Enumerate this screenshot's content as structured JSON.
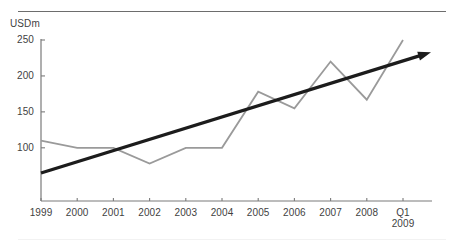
{
  "figure": {
    "top_partial_title": "",
    "unit_label": "USDm"
  },
  "chart_data": {
    "type": "line",
    "title": "",
    "subtitle": "",
    "xlabel": "",
    "ylabel": "USDm",
    "categories": [
      "1999",
      "2000",
      "2001",
      "2002",
      "2003",
      "2004",
      "2005",
      "2006",
      "2007",
      "2008",
      "Q1 2009"
    ],
    "x_tick_labels": [
      {
        "line1": "1999",
        "line2": ""
      },
      {
        "line1": "2000",
        "line2": ""
      },
      {
        "line1": "2001",
        "line2": ""
      },
      {
        "line1": "2002",
        "line2": ""
      },
      {
        "line1": "2003",
        "line2": ""
      },
      {
        "line1": "2004",
        "line2": ""
      },
      {
        "line1": "2005",
        "line2": ""
      },
      {
        "line1": "2006",
        "line2": ""
      },
      {
        "line1": "2007",
        "line2": ""
      },
      {
        "line1": "2008",
        "line2": ""
      },
      {
        "line1": "Q1",
        "line2": "2009"
      }
    ],
    "y_tick_labels": [
      "250",
      "200",
      "150",
      "100"
    ],
    "y_tick_values": [
      250,
      200,
      150,
      100
    ],
    "ylim": [
      26,
      250
    ],
    "grid": false,
    "legend": "none",
    "series": [
      {
        "name": "Value",
        "color": "#9a9a9a",
        "values": [
          110,
          100,
          100,
          78,
          100,
          100,
          178,
          155,
          220,
          167,
          250
        ]
      }
    ],
    "annotations": [
      {
        "type": "trend-arrow",
        "name": "trend-arrow",
        "color": "#1c1c1c",
        "start": {
          "x": "1999",
          "y": 65
        },
        "end": {
          "x": "Q1 2009",
          "y": 233
        },
        "has_arrowhead": true
      }
    ]
  }
}
